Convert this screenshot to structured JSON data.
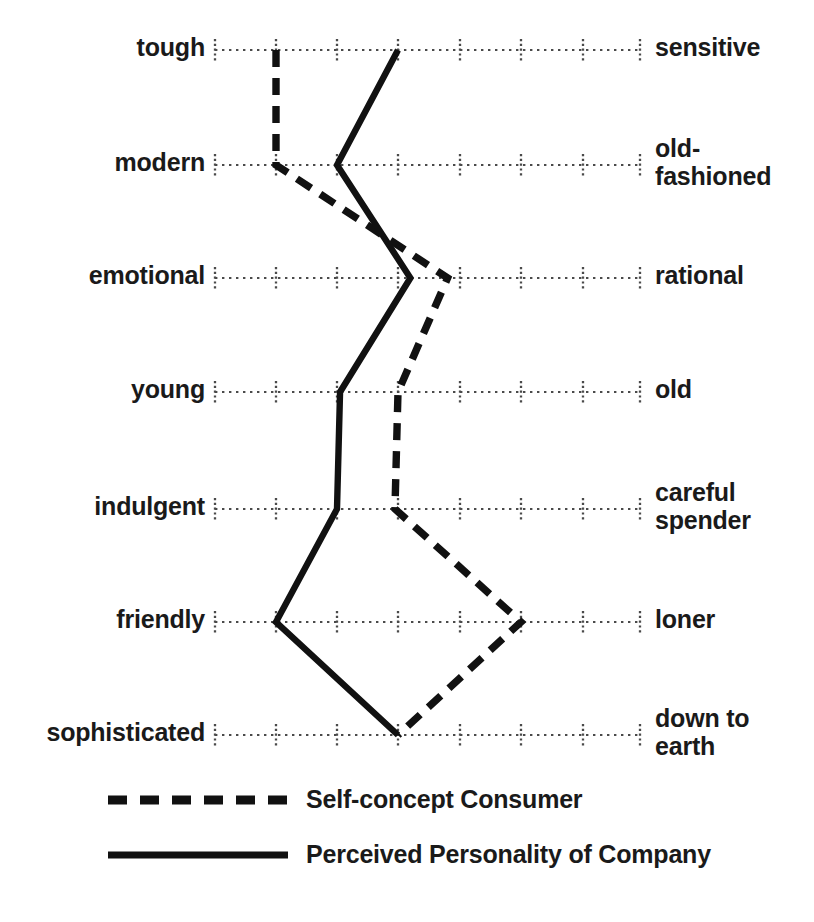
{
  "chart_data": {
    "type": "line",
    "title": "",
    "subtitle": "",
    "xlabel": "",
    "ylabel": "",
    "orientation": "horizontal-semantic-differential",
    "scale": {
      "points": 8,
      "tick_positions_px": [
        215,
        276,
        337,
        398,
        460,
        521,
        583,
        640
      ],
      "min": 1,
      "max": 8,
      "grid": true
    },
    "categories": [
      "tough — sensitive",
      "modern — old-fashioned",
      "emotional — rational",
      "young — old",
      "indulgent — careful spender",
      "friendly — loner",
      "sophisticated — down to earth"
    ],
    "left_labels": [
      "tough",
      "modern",
      "emotional",
      "young",
      "indulgent",
      "friendly",
      "sophisticated"
    ],
    "right_labels": [
      "sensitive",
      "old-\nfashioned",
      "rational",
      "old",
      "careful\nspender",
      "loner",
      "down to\nearth"
    ],
    "series": [
      {
        "name": "Self-concept Consumer",
        "style": "dashed",
        "color": "#111111",
        "values": [
          2.0,
          2.0,
          4.8,
          4.0,
          3.95,
          6.0,
          4.0
        ]
      },
      {
        "name": "Perceived Personality of Company",
        "style": "solid",
        "color": "#111111",
        "values": [
          4.0,
          3.0,
          4.2,
          3.05,
          3.0,
          2.0,
          4.0
        ]
      }
    ],
    "legend": {
      "position": "bottom-left",
      "entries": [
        {
          "label": "Self-concept Consumer",
          "style": "dashed"
        },
        {
          "label": "Perceived Personality of Company",
          "style": "solid"
        }
      ]
    }
  },
  "rows": [
    {
      "left": "tough",
      "right": "sensitive",
      "y": 50,
      "right_y": 50,
      "solid": 4.0,
      "dashed": 2.0
    },
    {
      "left": "modern",
      "right": "old-\nfashioned",
      "y": 165,
      "right_y": 151,
      "solid": 3.0,
      "dashed": 2.0
    },
    {
      "left": "emotional",
      "right": "rational",
      "y": 278,
      "right_y": 278,
      "solid": 4.2,
      "dashed": 4.8
    },
    {
      "left": "young",
      "right": "old",
      "y": 392,
      "right_y": 392,
      "solid": 3.05,
      "dashed": 4.0
    },
    {
      "left": "indulgent",
      "right": "careful\nspender",
      "y": 509,
      "right_y": 495,
      "solid": 3.0,
      "dashed": 3.95
    },
    {
      "left": "friendly",
      "right": "loner",
      "y": 622,
      "right_y": 622,
      "solid": 2.0,
      "dashed": 6.0
    },
    {
      "left": "sophisticated",
      "right": "down to\nearth",
      "y": 735,
      "right_y": 721,
      "solid": 4.0,
      "dashed": 4.0
    }
  ],
  "legend": {
    "dashed_label": "Self-concept Consumer",
    "solid_label": "Perceived Personality of Company"
  }
}
